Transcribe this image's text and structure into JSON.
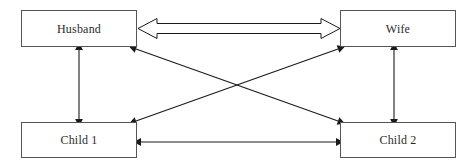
{
  "diagram": {
    "background_color": "#ffffff",
    "line_color": "#1a1a1a",
    "box_border_color": "#555555",
    "text_color": "#2b2b2b",
    "nodes": [
      {
        "id": "husband",
        "label": "Husband"
      },
      {
        "id": "wife",
        "label": "Wife"
      },
      {
        "id": "child1",
        "label": "Child 1"
      },
      {
        "id": "child2",
        "label": "Child 2"
      }
    ],
    "edges": [
      {
        "id": "husband-wife",
        "from": "Husband",
        "to": "Wife",
        "style": "hollow-block",
        "direction": "bidirectional",
        "orientation": "horizontal"
      },
      {
        "id": "husband-child1",
        "from": "Husband",
        "to": "Child 1",
        "style": "solid-line",
        "direction": "bidirectional",
        "orientation": "vertical"
      },
      {
        "id": "wife-child2",
        "from": "Wife",
        "to": "Child 2",
        "style": "solid-line",
        "direction": "bidirectional",
        "orientation": "vertical"
      },
      {
        "id": "child1-child2",
        "from": "Child 1",
        "to": "Child 2",
        "style": "solid-line",
        "direction": "bidirectional",
        "orientation": "horizontal"
      },
      {
        "id": "husband-child2",
        "from": "Husband",
        "to": "Child 2",
        "style": "solid-line",
        "direction": "bidirectional",
        "orientation": "diagonal"
      },
      {
        "id": "wife-child1",
        "from": "Wife",
        "to": "Child 1",
        "style": "solid-line",
        "direction": "bidirectional",
        "orientation": "diagonal"
      }
    ]
  }
}
